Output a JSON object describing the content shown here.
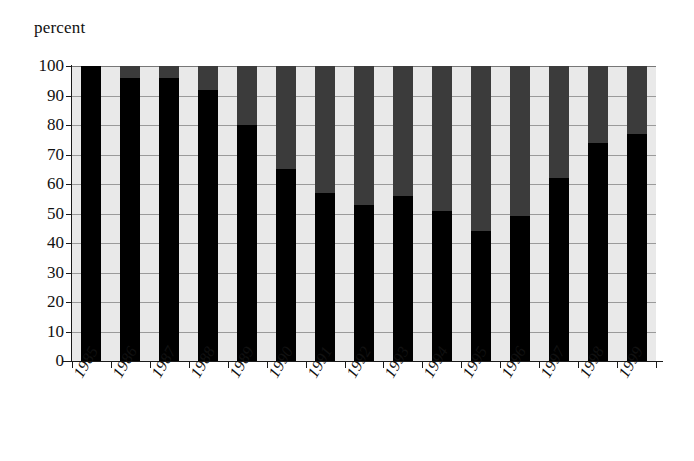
{
  "chart_data": {
    "type": "bar",
    "stacked": true,
    "title": "",
    "subtitle": "",
    "xlabel": "",
    "ylabel": "percent",
    "ylim": [
      0,
      100
    ],
    "xlim_categories": 15,
    "grid": true,
    "legend": "none",
    "y_ticks": [
      0,
      10,
      20,
      30,
      40,
      50,
      60,
      70,
      80,
      90,
      100
    ],
    "categories": [
      "1985",
      "1986",
      "1987",
      "1988",
      "1989",
      "1990",
      "1991",
      "1992",
      "1993",
      "1994",
      "1995",
      "1996",
      "1997",
      "1998",
      "1999"
    ],
    "series": [
      {
        "name": "lower-black-segment",
        "color": "#000000",
        "values": [
          100,
          96,
          96,
          92,
          80,
          65,
          57,
          53,
          56,
          51,
          44,
          49,
          62,
          74,
          77
        ]
      },
      {
        "name": "upper-gray-segment",
        "color": "#3b3b3b",
        "values": [
          0,
          4,
          4,
          8,
          20,
          35,
          43,
          47,
          44,
          49,
          56,
          51,
          38,
          26,
          23
        ]
      }
    ],
    "totals": [
      100,
      100,
      100,
      100,
      100,
      100,
      100,
      100,
      100,
      100,
      100,
      100,
      100,
      100,
      100
    ],
    "axis_colors": {
      "axis_line": "#1a1a1a",
      "gridline": "#9a9a9a",
      "plot_background": "#e9e9e9",
      "page_background": "#ffffff"
    }
  },
  "axis": {
    "y_title": "percent"
  }
}
